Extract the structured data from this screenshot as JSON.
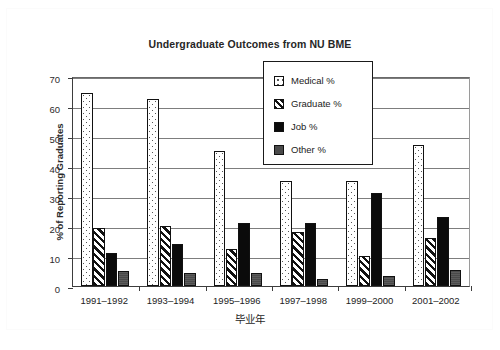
{
  "chart_data": {
    "type": "bar",
    "title": "Undergraduate Outcomes from NU BME",
    "xlabel": "毕业年",
    "ylabel": "% of Reporting Graduates",
    "ylim": [
      0,
      70
    ],
    "ytick_step": 10,
    "yticks": [
      "70",
      "60",
      "50",
      "40",
      "30",
      "20",
      "10",
      "0"
    ],
    "grid": true,
    "legend_position": "top-center-inside",
    "categories": [
      "1991–1992",
      "1993–1994",
      "1995–1996",
      "1997–1998",
      "1999–2000",
      "2001–2002"
    ],
    "series": [
      {
        "name": "Medical %",
        "key": "medical",
        "fill": "white-dotted",
        "values": [
          64.5,
          62.5,
          45.0,
          35.0,
          35.0,
          47.0
        ]
      },
      {
        "name": "Graduate %",
        "key": "graduate",
        "fill": "diagonal-hatch",
        "values": [
          19.5,
          20.0,
          12.5,
          18.0,
          10.0,
          16.0
        ]
      },
      {
        "name": "Job %",
        "key": "job",
        "fill": "solid-black",
        "values": [
          11.0,
          14.0,
          21.0,
          21.0,
          31.0,
          23.0
        ]
      },
      {
        "name": "Other %",
        "key": "other",
        "fill": "solid-gray",
        "values": [
          5.0,
          4.5,
          4.5,
          2.5,
          3.5,
          5.5
        ]
      }
    ]
  },
  "colors": {
    "axis": "#3d3d3d",
    "grid": "#7d7d7d",
    "job_black": "#0b0b0b",
    "other_gray": "#4a4a4a",
    "text": "#222222",
    "background": "#ffffff"
  }
}
